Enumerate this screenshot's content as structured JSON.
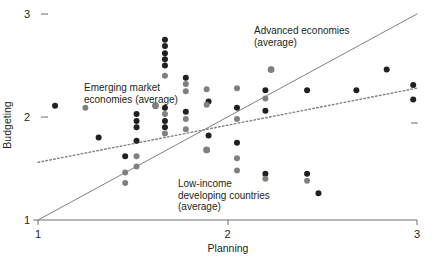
{
  "chart_data": {
    "type": "scatter",
    "title": "",
    "xlabel": "Planning",
    "ylabel": "Budgeting",
    "xlim": [
      1,
      3
    ],
    "ylim": [
      1,
      3
    ],
    "xticks": [
      1,
      2,
      3
    ],
    "yticks": [
      1,
      2,
      3
    ],
    "xticklabels": [
      "1",
      "2",
      "3"
    ],
    "yticklabels": [
      "1",
      "2",
      "3"
    ],
    "grid": false,
    "legend": "none",
    "annotations": [
      {
        "name": "emerging-market-economies-average",
        "text": "Emerging market\neconomies (average)",
        "marker_x": 1.62,
        "marker_y": 2.11,
        "marker_color": "#808080"
      },
      {
        "name": "advanced-economies-average",
        "text": "Advanced economies\n(average)",
        "marker_x": 2.23,
        "marker_y": 2.46,
        "marker_color": "#808080"
      },
      {
        "name": "low-income-developing-countries-average",
        "text": "Low-income\ndeveloping countries\n(average)",
        "marker_x": 1.89,
        "marker_y": 1.68,
        "marker_color": "#808080"
      }
    ],
    "series": [
      {
        "name": "dark-points",
        "color": "#231f20",
        "marker": "circle",
        "points": [
          [
            1.09,
            2.11
          ],
          [
            1.32,
            1.8
          ],
          [
            1.46,
            1.62
          ],
          [
            1.52,
            2.03
          ],
          [
            1.52,
            1.96
          ],
          [
            1.52,
            1.9
          ],
          [
            1.52,
            1.77
          ],
          [
            1.67,
            2.75
          ],
          [
            1.67,
            2.69
          ],
          [
            1.67,
            2.62
          ],
          [
            1.67,
            2.56
          ],
          [
            1.67,
            2.5
          ],
          [
            1.67,
            2.09
          ],
          [
            1.67,
            1.96
          ],
          [
            1.67,
            1.9
          ],
          [
            1.78,
            2.38
          ],
          [
            1.78,
            2.05
          ],
          [
            1.9,
            2.15
          ],
          [
            1.9,
            1.82
          ],
          [
            2.05,
            2.09
          ],
          [
            2.05,
            1.75
          ],
          [
            2.2,
            2.26
          ],
          [
            2.2,
            2.06
          ],
          [
            2.2,
            1.45
          ],
          [
            2.42,
            2.26
          ],
          [
            2.42,
            1.45
          ],
          [
            2.48,
            1.26
          ],
          [
            2.68,
            2.26
          ],
          [
            2.84,
            2.46
          ],
          [
            2.98,
            2.31
          ],
          [
            2.98,
            2.17
          ]
        ]
      },
      {
        "name": "gray-points",
        "color": "#808080",
        "marker": "circle",
        "points": [
          [
            1.25,
            2.09
          ],
          [
            1.46,
            1.46
          ],
          [
            1.46,
            1.36
          ],
          [
            1.52,
            1.62
          ],
          [
            1.52,
            1.52
          ],
          [
            1.62,
            2.11
          ],
          [
            1.67,
            2.4
          ],
          [
            1.67,
            2.03
          ],
          [
            1.67,
            1.84
          ],
          [
            1.78,
            2.32
          ],
          [
            1.78,
            2.25
          ],
          [
            1.78,
            1.98
          ],
          [
            1.78,
            1.88
          ],
          [
            1.89,
            2.27
          ],
          [
            1.89,
            2.12
          ],
          [
            1.89,
            1.68
          ],
          [
            2.05,
            2.28
          ],
          [
            2.05,
            1.98
          ],
          [
            2.05,
            1.6
          ],
          [
            2.05,
            1.48
          ],
          [
            2.2,
            2.18
          ],
          [
            2.2,
            1.4
          ],
          [
            2.23,
            2.46
          ],
          [
            2.42,
            1.38
          ]
        ]
      }
    ],
    "lines": [
      {
        "name": "identity-line",
        "style": "solid",
        "color": "#808080",
        "x1": 1.0,
        "y1": 1.0,
        "x2": 3.0,
        "y2": 3.0
      },
      {
        "name": "fitted-line",
        "style": "dotted",
        "color": "#808080",
        "x1": 1.0,
        "y1": 1.56,
        "x2": 3.0,
        "y2": 2.28
      }
    ]
  }
}
